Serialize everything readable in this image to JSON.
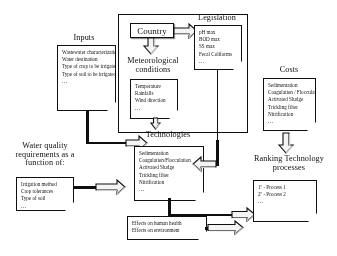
{
  "diagram": {
    "nodes": {
      "inputs": {
        "title": "Inputs",
        "items": [
          "Wastewater characterization",
          "Water destination",
          "Type of crop to be irrigated",
          "Type of soil to be irrigated"
        ],
        "ellipsis": "..."
      },
      "country": {
        "label": "Country"
      },
      "meteorological": {
        "title": "Meteorological conditions",
        "items": [
          "Temperature",
          "Rainfalls",
          "Wind direction"
        ],
        "ellipsis": "..."
      },
      "legislation": {
        "title": "Legislation",
        "items": [
          "pH max",
          "BOD max",
          "SS max",
          "Fecal Coliforms"
        ],
        "ellipsis": "..."
      },
      "costs": {
        "title": "Costs",
        "items": [
          "Sedimentation",
          "Coagulation / Flocculation",
          "Activated Sludge",
          "Trickling filter",
          "Nitrification"
        ],
        "ellipsis": "..."
      },
      "water_quality": {
        "title": "Water quality requirements as a function of:",
        "items": [
          "Irrigation method",
          "Crop tolerances",
          "Type of soil"
        ],
        "ellipsis": "..."
      },
      "technologies": {
        "title": "Technologies",
        "items": [
          "Sedimentation",
          "Coagulation/Flocculation",
          "Activated Sludge",
          "Trickling filter",
          "Nitrification"
        ],
        "ellipsis": "..."
      },
      "effects": {
        "items": [
          "Effects on human health",
          "Effects on environment"
        ]
      },
      "ranking": {
        "title": "Ranking Technology processes",
        "items": [
          "1º - Process 1",
          "2º - Process 2"
        ],
        "ellipsis": "..."
      }
    },
    "colors": {
      "stroke": "#111111",
      "background": "#ffffff",
      "arrow_fill": "#f2f2f2",
      "arrow_shadow": "#c9c9c9"
    }
  }
}
